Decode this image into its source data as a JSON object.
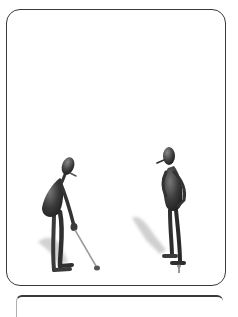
{
  "illustration": {
    "subject": "Two cartoon stick-figure golfers",
    "figures": [
      {
        "role": "golfer-addressing-ball",
        "pose": "bent forward holding club over ball",
        "icon": "golfer-figure"
      },
      {
        "role": "golfer-standing",
        "pose": "standing upright, hand on hip, wearing cap",
        "icon": "golfer-figure"
      }
    ],
    "objects": [
      "golf-club",
      "golf-ball",
      "golf-tee"
    ]
  },
  "colors": {
    "frame_border": "#3a3a3a",
    "background": "#ffffff",
    "figure_dark": "#2f2f2f",
    "figure_mid": "#555555",
    "shadow": "#c8c8c8",
    "club": "#9a9a9a"
  }
}
